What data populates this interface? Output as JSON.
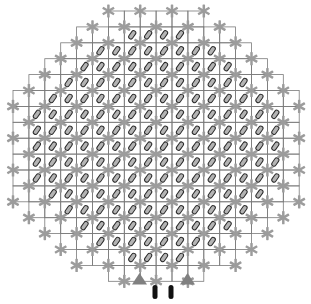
{
  "figure": {
    "name": "core-lattice-map",
    "background_color": "#ffffff",
    "width": 311,
    "height": 304
  },
  "lattice": {
    "cell_pitch": 15.9,
    "origin_x": 13.0,
    "origin_y": 11.0,
    "columns": 18,
    "rows": 17.5,
    "grid_line_color": "#7a7a7a",
    "grid_line_width": 0.8,
    "shape": "octagon",
    "row_extents": [
      {
        "row": 0,
        "start": 6,
        "end": 12
      },
      {
        "row": 1,
        "start": 4,
        "end": 14
      },
      {
        "row": 2,
        "start": 3,
        "end": 15
      },
      {
        "row": 3,
        "start": 2,
        "end": 16
      },
      {
        "row": 4,
        "start": 1,
        "end": 17
      },
      {
        "row": 5,
        "start": 0,
        "end": 18
      },
      {
        "row": 6,
        "start": 0,
        "end": 18
      },
      {
        "row": 7,
        "start": 0,
        "end": 18
      },
      {
        "row": 8,
        "start": 0,
        "end": 18
      },
      {
        "row": 9,
        "start": 0,
        "end": 18
      },
      {
        "row": 10,
        "start": 0,
        "end": 18
      },
      {
        "row": 11,
        "start": 0,
        "end": 18
      },
      {
        "row": 12,
        "start": 1,
        "end": 17
      },
      {
        "row": 13,
        "start": 2,
        "end": 16
      },
      {
        "row": 14,
        "start": 3,
        "end": 15
      },
      {
        "row": 15,
        "start": 4,
        "end": 14
      },
      {
        "row": 16,
        "start": 6,
        "end": 12
      }
    ]
  },
  "markers": {
    "node_marker": {
      "semantic_name": "spacer-grid-star",
      "glyph": "six-point-asterisk",
      "color": "#9c9c9c",
      "arm_length": 6.6,
      "arm_width": 2.5,
      "arm_count": 6
    },
    "cell_marker": {
      "semantic_name": "fuel-rod-capsule",
      "glyph": "diagonal-capsule",
      "stroke_color": "#2b2b2b",
      "fill_color": "#b4b4b4",
      "length": 9.2,
      "thickness": 4.4,
      "rotation_deg": -55,
      "stroke_width": 1.0
    }
  },
  "bottom_indicators": {
    "label": "core-support-indicators",
    "triangles": [
      {
        "name": "left-support-triangle",
        "cx": 139.5,
        "cy": 284.5,
        "half_width": 7.5,
        "height": 11.5,
        "color": "#808080"
      },
      {
        "name": "right-support-triangle",
        "cx": 187.5,
        "cy": 284.5,
        "half_width": 7.5,
        "height": 11.5,
        "color": "#808080"
      }
    ],
    "bars": [
      {
        "name": "left-instrument-bar",
        "cx": 155.0,
        "cy": 292.0,
        "width": 5.0,
        "height": 14.0,
        "color": "#111111"
      },
      {
        "name": "right-instrument-bar",
        "cx": 171.0,
        "cy": 292.0,
        "width": 5.0,
        "height": 14.0,
        "color": "#111111"
      }
    ]
  },
  "chart_data": {
    "type": "heatmap",
    "title": "",
    "xlabel": "",
    "ylabel": "",
    "categories": [],
    "values": [],
    "legend": []
  }
}
